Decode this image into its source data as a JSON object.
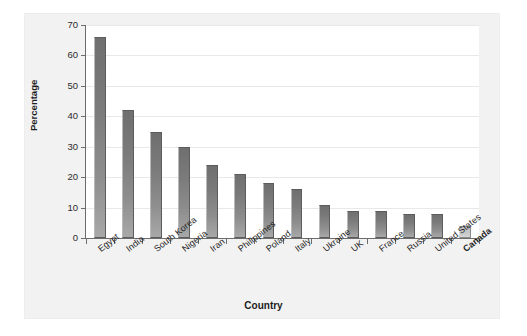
{
  "chart_data": {
    "type": "bar",
    "title": "",
    "xlabel": "Country",
    "ylabel": "Percentage",
    "categories": [
      "Egypt",
      "India",
      "South Korea",
      "Nigeria",
      "Iran",
      "Philippines",
      "Poland",
      "Italy",
      "Ukraine",
      "UK",
      "France",
      "Russia",
      "United States",
      "Canada"
    ],
    "values": [
      66,
      42,
      35,
      30,
      24,
      21,
      18,
      16,
      11,
      9,
      9,
      8,
      8,
      4
    ],
    "ylim": [
      0,
      70
    ],
    "yticks": [
      0,
      10,
      20,
      30,
      40,
      50,
      60,
      70
    ],
    "ytick_labels": [
      "0",
      "10",
      "20",
      "30",
      "40",
      "50",
      "60",
      "70"
    ],
    "grid": true,
    "legend": false,
    "highlighted_category": "Canada",
    "bold_tick_labels": [
      "Canada"
    ],
    "colors": {
      "bar_top": "#6f6f6f",
      "bar_bottom": "#a8a8a8",
      "bar_edge": "#5c5c5c",
      "highlight_bar_top": "#bdbdbd",
      "highlight_bar_bottom": "#d6d6d6",
      "grid": "#e8e8ec",
      "axis": "#6d6d6d",
      "panel_background": "#f2f2f2",
      "plot_background": "#ffffff",
      "text": "#1d1d1d"
    }
  }
}
